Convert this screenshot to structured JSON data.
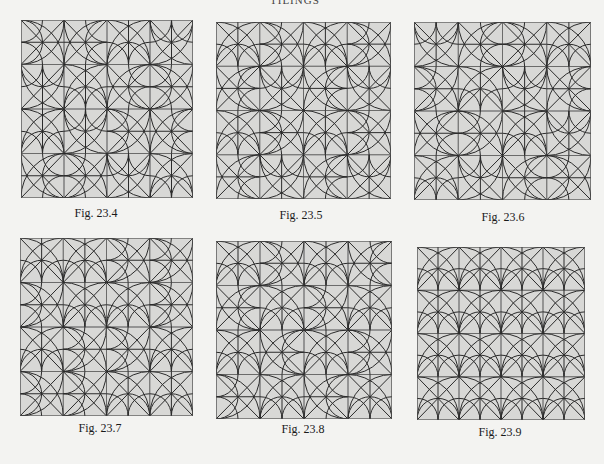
{
  "page": {
    "header_text": "TILINGS",
    "colors": {
      "background": "#f3f3f1",
      "tile_fill": "#d8d8d6",
      "line": "#2b2b2b",
      "border": "#555555"
    }
  },
  "figures": [
    {
      "id": "fig-23-4",
      "caption": "Fig. 23.4",
      "box": {
        "x": 21,
        "y": 20,
        "w": 172,
        "h": 178
      },
      "caption_pos": {
        "x": 96,
        "y": 206
      },
      "grid": 4,
      "orientations": [
        [
          1,
          3,
          0,
          2
        ],
        [
          2,
          0,
          3,
          1
        ],
        [
          0,
          2,
          1,
          3
        ],
        [
          3,
          1,
          2,
          0
        ]
      ]
    },
    {
      "id": "fig-23-5",
      "caption": "Fig. 23.5",
      "box": {
        "x": 216,
        "y": 22,
        "w": 175,
        "h": 177
      },
      "caption_pos": {
        "x": 301,
        "y": 208
      },
      "grid": 4,
      "orientations": [
        [
          0,
          1,
          0,
          1
        ],
        [
          3,
          2,
          3,
          2
        ],
        [
          0,
          1,
          0,
          1
        ],
        [
          3,
          2,
          3,
          2
        ]
      ]
    },
    {
      "id": "fig-23-6",
      "caption": "Fig. 23.6",
      "box": {
        "x": 414,
        "y": 22,
        "w": 177,
        "h": 178
      },
      "caption_pos": {
        "x": 503,
        "y": 210
      },
      "grid": 4,
      "orientations": [
        [
          2,
          3,
          1,
          0
        ],
        [
          1,
          0,
          2,
          3
        ],
        [
          3,
          1,
          0,
          2
        ],
        [
          0,
          2,
          3,
          1
        ]
      ]
    },
    {
      "id": "fig-23-7",
      "caption": "Fig. 23.7",
      "box": {
        "x": 20,
        "y": 238,
        "w": 173,
        "h": 178
      },
      "caption_pos": {
        "x": 100,
        "y": 421
      },
      "grid": 4,
      "orientations": [
        [
          0,
          0,
          1,
          1
        ],
        [
          1,
          0,
          0,
          1
        ],
        [
          0,
          1,
          1,
          0
        ],
        [
          1,
          1,
          0,
          0
        ]
      ]
    },
    {
      "id": "fig-23-8",
      "caption": "Fig. 23.8",
      "box": {
        "x": 216,
        "y": 241,
        "w": 176,
        "h": 178
      },
      "caption_pos": {
        "x": 303,
        "y": 422
      },
      "grid": 4,
      "orientations": [
        [
          0,
          1,
          0,
          3
        ],
        [
          3,
          0,
          1,
          0
        ],
        [
          0,
          3,
          0,
          1
        ],
        [
          1,
          0,
          3,
          0
        ]
      ]
    },
    {
      "id": "fig-23-9",
      "caption": "Fig. 23.9",
      "box": {
        "x": 417,
        "y": 247,
        "w": 168,
        "h": 173
      },
      "caption_pos": {
        "x": 500,
        "y": 425
      },
      "grid": 4,
      "orientations": [
        [
          0,
          0,
          0,
          0
        ],
        [
          0,
          0,
          0,
          0
        ],
        [
          0,
          0,
          0,
          0
        ],
        [
          0,
          0,
          0,
          0
        ]
      ]
    }
  ]
}
